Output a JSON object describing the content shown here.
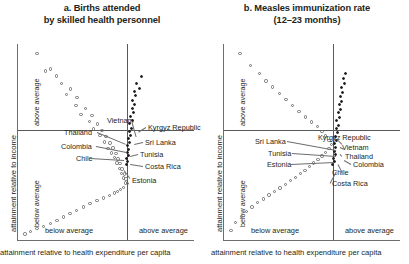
{
  "figure": {
    "axis_title": "attainment relative to health expenditure per capita",
    "y_axis_title": "attainment relative to income",
    "quadrant_labels": {
      "y_above": "above average",
      "y_below": "below average",
      "x_below": "below average",
      "x_above": "above average"
    }
  },
  "panels": [
    {
      "id": "panel-a",
      "title_line1": "a. Births attended",
      "title_line2": "by skilled health personnel",
      "labels": [
        {
          "text": "Thailand",
          "x": 46,
          "y": 84
        },
        {
          "text": "Vietnam",
          "x": 89,
          "y": 72
        },
        {
          "text": "Kyrgyz Republic",
          "x": 130,
          "y": 79
        },
        {
          "text": "Colombia",
          "x": 43,
          "y": 98
        },
        {
          "text": "Sri Lanka",
          "x": 127,
          "y": 94
        },
        {
          "text": "Chile",
          "x": 58,
          "y": 110
        },
        {
          "text": "Tunisia",
          "x": 122,
          "y": 106
        },
        {
          "text": "Costa Rica",
          "x": 127,
          "y": 118
        },
        {
          "text": "Estonia",
          "x": 114,
          "y": 132
        }
      ]
    },
    {
      "id": "panel-b",
      "title_line1": "b. Measles immunization rate",
      "title_line2": "(12–23 months)",
      "labels": [
        {
          "text": "Sri Lanka",
          "x": 31,
          "y": 93
        },
        {
          "text": "Kyrgyz Republic",
          "x": 94,
          "y": 89
        },
        {
          "text": "Tunisia",
          "x": 44,
          "y": 105
        },
        {
          "text": "Vietnam",
          "x": 118,
          "y": 99
        },
        {
          "text": "Thailand",
          "x": 121,
          "y": 108
        },
        {
          "text": "Estonia",
          "x": 43,
          "y": 116
        },
        {
          "text": "Colombia",
          "x": 129,
          "y": 116
        },
        {
          "text": "Chile",
          "x": 108,
          "y": 124
        },
        {
          "text": "Costa Rica",
          "x": 108,
          "y": 135
        }
      ]
    }
  ],
  "chart_data": {
    "type": "scatter",
    "xlabel": "attainment relative to health expenditure per capita",
    "ylabel": "attainment relative to income",
    "grid": false,
    "legend": "none",
    "xlim": [
      0,
      1
    ],
    "ylim": [
      0,
      1
    ],
    "origin": {
      "x": 0.62,
      "y": 0.44
    },
    "series": [
      {
        "name": "a. Births attended by skilled health personnel",
        "panel": "panel-a",
        "points_open": [
          [
            0.108,
            0.952
          ],
          [
            0.185,
            0.872
          ],
          [
            0.218,
            0.836
          ],
          [
            0.158,
            0.862
          ],
          [
            0.246,
            0.8
          ],
          [
            0.3,
            0.77
          ],
          [
            0.276,
            0.742
          ],
          [
            0.336,
            0.728
          ],
          [
            0.33,
            0.686
          ],
          [
            0.384,
            0.672
          ],
          [
            0.358,
            0.64
          ],
          [
            0.42,
            0.636
          ],
          [
            0.408,
            0.604
          ],
          [
            0.452,
            0.592
          ],
          [
            0.43,
            0.566
          ],
          [
            0.478,
            0.56
          ],
          [
            0.466,
            0.532
          ],
          [
            0.5,
            0.528
          ],
          [
            0.492,
            0.5
          ],
          [
            0.522,
            0.494
          ],
          [
            0.512,
            0.468
          ],
          [
            0.54,
            0.47
          ],
          [
            0.532,
            0.444
          ],
          [
            0.556,
            0.44
          ],
          [
            0.548,
            0.42
          ],
          [
            0.568,
            0.414
          ],
          [
            0.562,
            0.392
          ],
          [
            0.58,
            0.39
          ],
          [
            0.576,
            0.366
          ],
          [
            0.592,
            0.362
          ],
          [
            0.588,
            0.34
          ],
          [
            0.604,
            0.336
          ],
          [
            0.6,
            0.316
          ],
          [
            0.614,
            0.312
          ],
          [
            0.61,
            0.29
          ],
          [
            0.622,
            0.288
          ],
          [
            0.6,
            0.268
          ],
          [
            0.584,
            0.258
          ],
          [
            0.566,
            0.248
          ],
          [
            0.548,
            0.24
          ],
          [
            0.52,
            0.226
          ],
          [
            0.486,
            0.214
          ],
          [
            0.448,
            0.2
          ],
          [
            0.41,
            0.186
          ],
          [
            0.372,
            0.168
          ],
          [
            0.334,
            0.15
          ],
          [
            0.296,
            0.134
          ],
          [
            0.258,
            0.118
          ],
          [
            0.222,
            0.1
          ],
          [
            0.184,
            0.084
          ],
          [
            0.146,
            0.07
          ],
          [
            0.108,
            0.058
          ],
          [
            0.07,
            0.044
          ],
          [
            0.04,
            0.03
          ]
        ],
        "points_solid": [
          [
            0.7,
            0.832
          ],
          [
            0.672,
            0.8
          ],
          [
            0.688,
            0.772
          ],
          [
            0.66,
            0.76
          ],
          [
            0.668,
            0.736
          ],
          [
            0.652,
            0.712
          ],
          [
            0.664,
            0.69
          ],
          [
            0.648,
            0.672
          ],
          [
            0.656,
            0.648
          ],
          [
            0.64,
            0.632
          ],
          [
            0.648,
            0.608
          ],
          [
            0.636,
            0.592
          ],
          [
            0.644,
            0.57
          ],
          [
            0.632,
            0.554
          ],
          [
            0.64,
            0.532
          ],
          [
            0.628,
            0.516
          ],
          [
            0.636,
            0.496
          ],
          [
            0.624,
            0.48
          ],
          [
            0.63,
            0.462
          ],
          [
            0.62,
            0.448
          ],
          [
            0.626,
            0.43
          ],
          [
            0.616,
            0.414
          ],
          [
            0.622,
            0.398
          ],
          [
            0.614,
            0.384
          ]
        ]
      },
      {
        "name": "b. Measles immunization rate (12–23 months)",
        "panel": "panel-b",
        "points_open": [
          [
            0.09,
            0.95
          ],
          [
            0.15,
            0.89
          ],
          [
            0.2,
            0.848
          ],
          [
            0.238,
            0.812
          ],
          [
            0.276,
            0.78
          ],
          [
            0.314,
            0.748
          ],
          [
            0.352,
            0.716
          ],
          [
            0.39,
            0.686
          ],
          [
            0.426,
            0.656
          ],
          [
            0.462,
            0.628
          ],
          [
            0.496,
            0.602
          ],
          [
            0.53,
            0.578
          ],
          [
            0.556,
            0.554
          ],
          [
            0.578,
            0.53
          ],
          [
            0.596,
            0.508
          ],
          [
            0.61,
            0.488
          ],
          [
            0.596,
            0.466
          ],
          [
            0.576,
            0.446
          ],
          [
            0.556,
            0.428
          ],
          [
            0.534,
            0.41
          ],
          [
            0.51,
            0.392
          ],
          [
            0.486,
            0.374
          ],
          [
            0.46,
            0.356
          ],
          [
            0.434,
            0.338
          ],
          [
            0.406,
            0.32
          ],
          [
            0.378,
            0.302
          ],
          [
            0.348,
            0.284
          ],
          [
            0.318,
            0.266
          ],
          [
            0.288,
            0.248
          ],
          [
            0.256,
            0.23
          ],
          [
            0.224,
            0.21
          ],
          [
            0.192,
            0.19
          ],
          [
            0.16,
            0.168
          ],
          [
            0.128,
            0.146
          ],
          [
            0.098,
            0.12
          ],
          [
            0.066,
            0.09
          ],
          [
            0.04,
            0.05
          ]
        ],
        "points_solid": [
          [
            0.692,
            0.848
          ],
          [
            0.678,
            0.822
          ],
          [
            0.686,
            0.796
          ],
          [
            0.668,
            0.778
          ],
          [
            0.676,
            0.752
          ],
          [
            0.66,
            0.732
          ],
          [
            0.668,
            0.708
          ],
          [
            0.654,
            0.69
          ],
          [
            0.66,
            0.666
          ],
          [
            0.648,
            0.648
          ],
          [
            0.654,
            0.626
          ],
          [
            0.642,
            0.608
          ],
          [
            0.65,
            0.586
          ],
          [
            0.638,
            0.568
          ],
          [
            0.644,
            0.546
          ],
          [
            0.634,
            0.528
          ],
          [
            0.64,
            0.508
          ],
          [
            0.63,
            0.49
          ],
          [
            0.636,
            0.472
          ],
          [
            0.626,
            0.454
          ],
          [
            0.632,
            0.436
          ],
          [
            0.622,
            0.418
          ],
          [
            0.628,
            0.4
          ],
          [
            0.618,
            0.384
          ]
        ]
      }
    ]
  }
}
